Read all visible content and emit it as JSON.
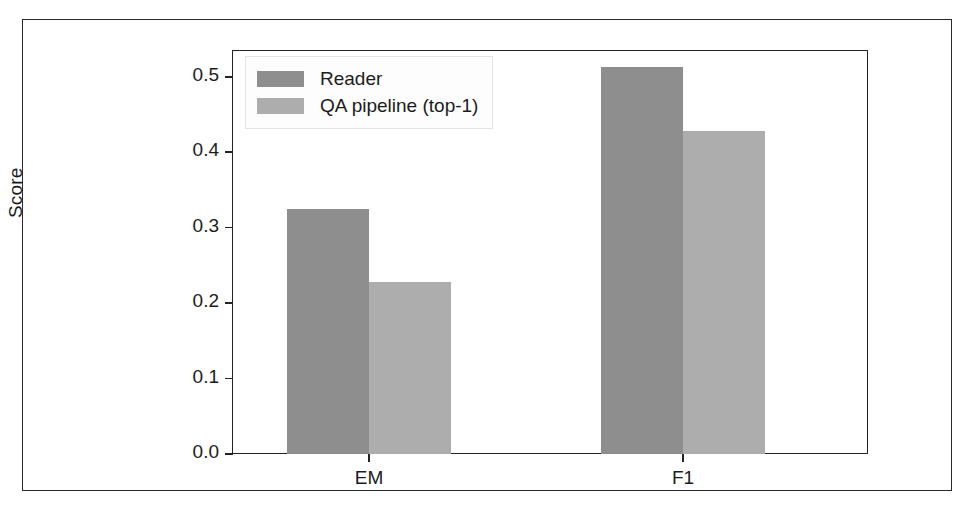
{
  "chart_data": {
    "type": "bar",
    "title": "",
    "xlabel": "",
    "ylabel": "Score",
    "categories": [
      "EM",
      "F1"
    ],
    "series": [
      {
        "name": "Reader",
        "values": [
          0.325,
          0.513
        ],
        "color": "#8e8e8e"
      },
      {
        "name": "QA pipeline (top-1)",
        "values": [
          0.228,
          0.428
        ],
        "color": "#adadad"
      }
    ],
    "ylim": [
      0.0,
      0.55
    ],
    "yticks": [
      "0.0",
      "0.1",
      "0.2",
      "0.3",
      "0.4",
      "0.5"
    ],
    "ytick_values": [
      0.0,
      0.1,
      0.2,
      0.3,
      0.4,
      0.5
    ],
    "grid": false,
    "legend_position": "upper left"
  },
  "axes": {
    "ylabel": "Score",
    "yticks": [
      {
        "label": "0.0",
        "value": 0.0
      },
      {
        "label": "0.1",
        "value": 0.1
      },
      {
        "label": "0.2",
        "value": 0.2
      },
      {
        "label": "0.3",
        "value": 0.3
      },
      {
        "label": "0.4",
        "value": 0.4
      },
      {
        "label": "0.5",
        "value": 0.5
      }
    ],
    "xticks": [
      {
        "label": "EM"
      },
      {
        "label": "F1"
      }
    ]
  },
  "legend": {
    "items": [
      {
        "label": "Reader",
        "color": "#8e8e8e"
      },
      {
        "label": "QA pipeline (top-1)",
        "color": "#adadad"
      }
    ]
  },
  "caption": {
    "text": ""
  }
}
